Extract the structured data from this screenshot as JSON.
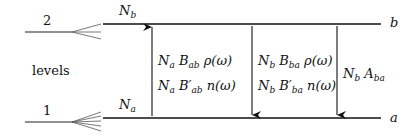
{
  "diagram": {
    "side_label": "levels",
    "levels": [
      {
        "id": "upper",
        "number": "2",
        "letter": "b",
        "population": "N",
        "population_sub": "b"
      },
      {
        "id": "lower",
        "number": "1",
        "letter": "a",
        "population": "N",
        "population_sub": "a"
      }
    ],
    "transitions": [
      {
        "id": "absorption",
        "direction": "up",
        "lines": [
          {
            "text": "N",
            "sub1": "a",
            "mid": " B",
            "sub2": "ab",
            "tail": " ρ(ω)"
          },
          {
            "text": "N",
            "sub1": "a",
            "mid": " B′",
            "sub2": "ab",
            "tail": " n(ω)"
          }
        ]
      },
      {
        "id": "stimulated-emission",
        "direction": "down",
        "lines": [
          {
            "text": "N",
            "sub1": "b",
            "mid": " B",
            "sub2": "ba",
            "tail": " ρ(ω)"
          },
          {
            "text": "N",
            "sub1": "b",
            "mid": " B′",
            "sub2": "ba",
            "tail": " n(ω)"
          }
        ]
      },
      {
        "id": "spontaneous-emission",
        "direction": "down",
        "lines": [
          {
            "text": "N",
            "sub1": "b",
            "mid": " A",
            "sub2": "ba",
            "tail": ""
          }
        ]
      }
    ]
  }
}
